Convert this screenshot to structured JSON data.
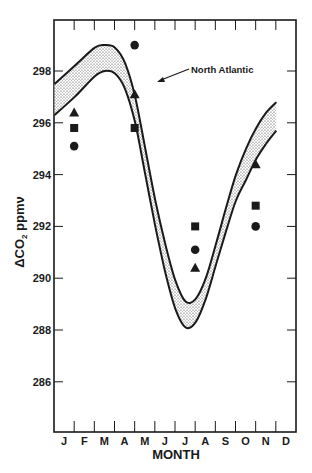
{
  "chart_data": {
    "type": "scatter",
    "title": "",
    "xlabel": "MONTH",
    "ylabel": "ΔCO₂ ppmν",
    "ylabel_parts": {
      "delta": "ΔCO",
      "sub": "2",
      "unit": " ppmν"
    },
    "categories": [
      "J",
      "F",
      "M",
      "A",
      "M",
      "J",
      "J",
      "A",
      "S",
      "O",
      "N",
      "D"
    ],
    "yticks": [
      286,
      288,
      290,
      292,
      294,
      296,
      298
    ],
    "ylim": [
      284.0,
      300.0
    ],
    "grid": false,
    "legend": null,
    "annotation": {
      "text": "North Atlantic",
      "target": "shaded seasonal band"
    },
    "band": {
      "name": "North Atlantic",
      "description": "Shaded envelope of seasonal ΔCO2 cycle",
      "x_month": [
        1.0,
        2.0,
        3.0,
        3.5,
        4.0,
        4.5,
        5.0,
        5.5,
        6.0,
        6.5,
        7.0,
        7.5,
        8.0,
        8.5,
        9.0,
        9.5,
        10.0,
        10.5,
        11.0,
        11.5,
        12.0
      ],
      "upper": [
        297.5,
        298.2,
        298.9,
        299.0,
        298.9,
        298.3,
        297.0,
        295.0,
        293.0,
        291.3,
        289.9,
        289.1,
        289.2,
        290.0,
        291.3,
        292.7,
        294.0,
        295.0,
        295.8,
        296.4,
        296.8
      ],
      "lower": [
        296.3,
        297.0,
        297.8,
        298.0,
        297.9,
        297.3,
        296.0,
        294.0,
        292.0,
        290.2,
        288.8,
        288.1,
        288.3,
        289.2,
        290.5,
        291.8,
        293.0,
        293.8,
        294.6,
        295.2,
        295.7
      ]
    },
    "series": [
      {
        "name": "triangle",
        "marker": "triangle",
        "x": [
          "J",
          "A",
          "J",
          "O"
        ],
        "x_month": [
          1,
          4,
          7,
          10
        ],
        "values": [
          296.4,
          297.1,
          290.4,
          294.4
        ]
      },
      {
        "name": "square",
        "marker": "square",
        "x": [
          "J",
          "A",
          "J",
          "O"
        ],
        "x_month": [
          1,
          4,
          7,
          10
        ],
        "values": [
          295.8,
          295.8,
          292.0,
          292.8
        ]
      },
      {
        "name": "circle",
        "marker": "circle",
        "x": [
          "J",
          "A",
          "J",
          "O"
        ],
        "x_month": [
          1,
          4,
          7,
          10
        ],
        "values": [
          295.1,
          299.0,
          291.1,
          292.0
        ]
      }
    ]
  },
  "colors": {
    "ink": "#1a1a1a",
    "band_fill": "#d9d9d9",
    "background": "#ffffff"
  }
}
